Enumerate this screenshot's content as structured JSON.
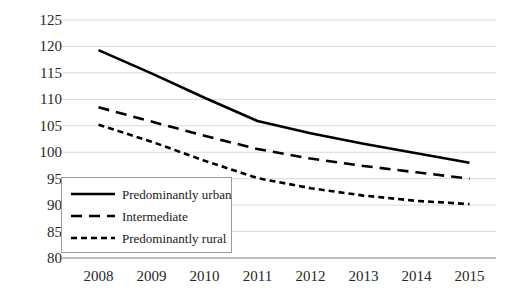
{
  "chart_data": {
    "type": "line",
    "title": "",
    "xlabel": "",
    "ylabel": "",
    "x": [
      2008,
      2009,
      2010,
      2011,
      2012,
      2013,
      2014,
      2015
    ],
    "categories": [
      "2008",
      "2009",
      "2010",
      "2011",
      "2012",
      "2013",
      "2014",
      "2015"
    ],
    "ylim": [
      80,
      125
    ],
    "y_ticks": [
      125,
      120,
      115,
      110,
      105,
      100,
      95,
      90,
      85,
      80
    ],
    "grid": "horizontal",
    "legend_position": "inside-lower-left",
    "series": [
      {
        "name": "Predominantly urban",
        "style": "solid",
        "color": "#000000",
        "values": [
          119.3,
          114.9,
          110.3,
          105.9,
          103.6,
          101.6,
          99.8,
          98.0
        ]
      },
      {
        "name": "Intermediate",
        "style": "dashed",
        "color": "#000000",
        "values": [
          108.5,
          105.8,
          103.1,
          100.6,
          98.8,
          97.4,
          96.2,
          95.0
        ]
      },
      {
        "name": "Predominantly rural",
        "style": "dotted",
        "color": "#000000",
        "values": [
          105.2,
          102.0,
          98.4,
          95.1,
          93.2,
          91.8,
          90.8,
          90.2
        ]
      }
    ]
  },
  "axes": {
    "y_tick_labels": [
      "125",
      "120",
      "115",
      "110",
      "105",
      "100",
      "95",
      "90",
      "85",
      "80"
    ],
    "x_tick_labels": [
      "2008",
      "2009",
      "2010",
      "2011",
      "2012",
      "2013",
      "2014",
      "2015"
    ]
  },
  "legend": {
    "items": [
      {
        "label": "Predominantly urban",
        "style": "solid"
      },
      {
        "label": "Intermediate",
        "style": "dashed"
      },
      {
        "label": "Predominantly rural",
        "style": "dotted"
      }
    ]
  },
  "colors": {
    "series_line": "#000000",
    "gridline": "#d9d9d9",
    "axis_line": "#7f7f7f",
    "tick_text": "#262626",
    "legend_border": "#9a9a9a",
    "background": "#ffffff"
  }
}
